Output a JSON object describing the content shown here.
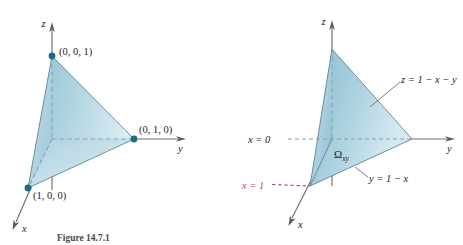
{
  "figure": {
    "caption": "Figure 14.7.1",
    "background_color": "#ffffff",
    "surface_color": "#a8cddb",
    "surface_color_light": "#cfe5ed",
    "base_color": "#b9bdbf",
    "vertex_color": "#1b6b84",
    "axis_color": "#6f6f6f",
    "accent_red": "#d4444a"
  },
  "left_panel": {
    "name": "tetrahedron-vertices",
    "axes": {
      "x_label": "x",
      "y_label": "y",
      "z_label": "z"
    },
    "vertices": [
      {
        "label": "(0, 0, 1)",
        "name": "vertex-z"
      },
      {
        "label": "(0, 1, 0)",
        "name": "vertex-y"
      },
      {
        "label": "(1, 0, 0)",
        "name": "vertex-x"
      }
    ]
  },
  "right_panel": {
    "name": "tetrahedron-equations",
    "axes": {
      "x_label": "x",
      "y_label": "y",
      "z_label": "z"
    },
    "annotations": [
      {
        "name": "plane-equation",
        "text": "z = 1 − x − y",
        "color": "#1c1c1c"
      },
      {
        "name": "x-equals-zero",
        "text": "x = 0",
        "color": "#1c1c1c"
      },
      {
        "name": "x-equals-one",
        "text": "x = 1",
        "color": "#d4444a"
      },
      {
        "name": "region-omega",
        "text": "Ω",
        "subscript": "xy",
        "color": "#1c1c1c"
      },
      {
        "name": "boundary-line",
        "text": "y = 1 − x",
        "color": "#1c1c1c"
      }
    ]
  }
}
